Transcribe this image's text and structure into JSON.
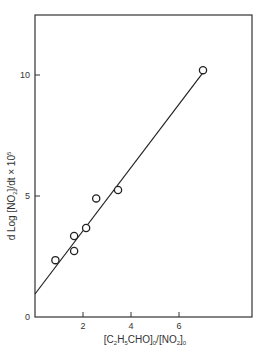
{
  "chart_data": {
    "type": "scatter",
    "title": "",
    "xlabel": "[C2H5CHO]0/[NO2]0",
    "xlabel_parts": {
      "pre": "[C",
      "sub1": "2",
      "mid1": "H",
      "sub2": "5",
      "mid2": "CHO]",
      "sub3": "0",
      "mid3": "/[NO",
      "sub4": "2",
      "mid4": "]",
      "sub5": "0"
    },
    "ylabel": "d Log [NO2]/dt × 10^5",
    "ylabel_parts": {
      "pre": "d Log [NO",
      "sub": "2",
      "mid": "]/dt × 10",
      "sup": "5"
    },
    "xlim": [
      0,
      9
    ],
    "ylim": [
      0,
      12.5
    ],
    "x_ticks": [
      2,
      4,
      6
    ],
    "y_ticks": [
      0,
      5,
      10
    ],
    "x_tick_labels": [
      "2",
      "4",
      "6"
    ],
    "y_tick_labels": [
      "0",
      "5",
      "10"
    ],
    "grid": false,
    "legend": null,
    "series": [
      {
        "name": "data",
        "marker": "open-circle",
        "points": [
          {
            "x": 0.85,
            "y": 2.35
          },
          {
            "x": 1.63,
            "y": 2.73
          },
          {
            "x": 1.63,
            "y": 3.35
          },
          {
            "x": 2.13,
            "y": 3.68
          },
          {
            "x": 2.55,
            "y": 4.9
          },
          {
            "x": 3.46,
            "y": 5.25
          },
          {
            "x": 7.0,
            "y": 10.2
          }
        ]
      },
      {
        "name": "fit",
        "type": "line",
        "points": [
          {
            "x": 0,
            "y": 0.95
          },
          {
            "x": 7.0,
            "y": 10.1
          }
        ]
      }
    ]
  }
}
